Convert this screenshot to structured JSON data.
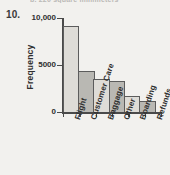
{
  "exercise": {
    "number": "10.",
    "cut_off_header": "b. 220 square millimeters"
  },
  "chart_data": {
    "type": "bar",
    "title": "",
    "xlabel": "",
    "ylabel": "Frequency",
    "categories": [
      "Flight",
      "Customer Care",
      "Baggage",
      "Other",
      "Boarding",
      "Refunds"
    ],
    "values": [
      9200,
      4400,
      3500,
      3300,
      1700,
      1200
    ],
    "ylim": [
      0,
      10000
    ],
    "yticks": [
      0,
      5000,
      10000
    ],
    "ytick_labels": [
      "0",
      "5000",
      "10,000"
    ],
    "grid": false,
    "legend": null,
    "bar_fills": [
      "#dedcd7",
      "#b9b8b3",
      "#dedcd7",
      "#b9b8b3",
      "#dedcd7",
      "#b9b8b3"
    ],
    "bar_outline": "#5c5c5c"
  }
}
